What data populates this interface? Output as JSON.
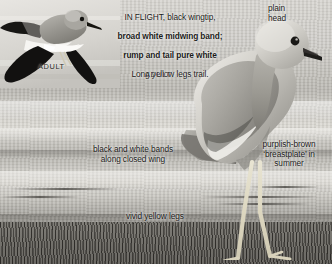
{
  "plate": {
    "title": "Bird identification photo plate",
    "background_color": "#c9c7c2",
    "grass_color": "#56544f"
  },
  "inset": {
    "name": "flight-inset-photo",
    "caption": "ADULT",
    "subject": "plover in flight, black wingtips, white midwing band"
  },
  "main_photo": {
    "name": "standing-plover-photo",
    "caption": "ADULT",
    "subject": "plover standing on grass, plain head, yellow legs"
  },
  "flight_note": {
    "line1": "IN FLIGHT, black wingtip,",
    "line2": "broad white midwing band;",
    "line3": "rump and tail pure white",
    "line3_tail": ".",
    "line4": "Long yellow legs trail."
  },
  "labels": {
    "plain_head": "plain\nhead",
    "wing_bands": "black and white bands\nalong closed wing",
    "breastplate": "purplish-brown\n‘breastplate’ in\nsummer",
    "legs": "vivid yellow legs"
  }
}
